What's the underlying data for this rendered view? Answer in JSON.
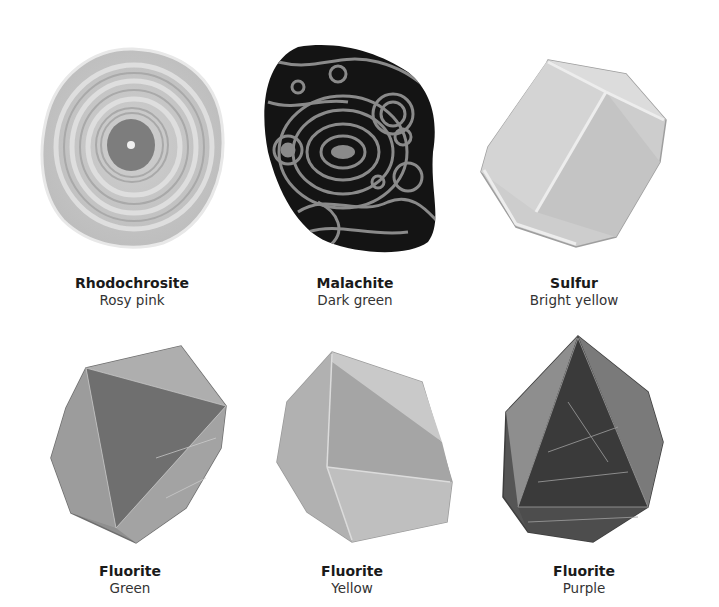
{
  "figure": {
    "specimens": [
      {
        "name": "Rhodochrosite",
        "color": "Rosy pink"
      },
      {
        "name": "Malachite",
        "color": "Dark green"
      },
      {
        "name": "Sulfur",
        "color": "Bright yellow"
      },
      {
        "name": "Fluorite",
        "color": "Green"
      },
      {
        "name": "Fluorite",
        "color": "Yellow"
      },
      {
        "name": "Fluorite",
        "color": "Purple"
      }
    ]
  }
}
